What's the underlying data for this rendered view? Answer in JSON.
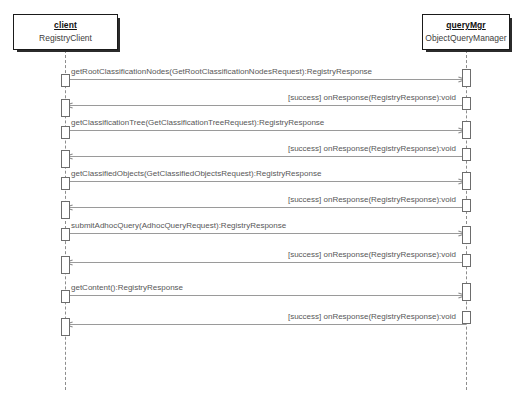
{
  "diagram": {
    "kind": "uml-sequence-diagram",
    "background_color": "#ffffff",
    "line_color": "#9a9a9a",
    "text_color": "#575757"
  },
  "participants": [
    {
      "id": "client",
      "name": "client",
      "class_name": "RegistryClient"
    },
    {
      "id": "queryMgr",
      "name": "queryMgr",
      "class_name": "ObjectQueryManager"
    }
  ],
  "messages": [
    {
      "index": 1,
      "direction": "to-right",
      "from": "client",
      "to": "queryMgr",
      "label": "getRootClassificationNodes(GetRootClassificationNodesRequest):RegistryResponse"
    },
    {
      "index": 2,
      "direction": "to-left",
      "from": "queryMgr",
      "to": "client",
      "label": "[success] onResponse(RegistryResponse):void"
    },
    {
      "index": 3,
      "direction": "to-right",
      "from": "client",
      "to": "queryMgr",
      "label": "getClassificationTree(GetClassificationTreeRequest):RegistryResponse"
    },
    {
      "index": 4,
      "direction": "to-left",
      "from": "queryMgr",
      "to": "client",
      "label": "[success] onResponse(RegistryResponse):void"
    },
    {
      "index": 5,
      "direction": "to-right",
      "from": "client",
      "to": "queryMgr",
      "label": "getClassifiedObjects(GetClassifiedObjectsRequest):RegistryResponse"
    },
    {
      "index": 6,
      "direction": "to-left",
      "from": "queryMgr",
      "to": "client",
      "label": "[success] onResponse(RegistryResponse):void"
    },
    {
      "index": 7,
      "direction": "to-right",
      "from": "client",
      "to": "queryMgr",
      "label": "submitAdhocQuery(AdhocQueryRequest):RegistryResponse"
    },
    {
      "index": 8,
      "direction": "to-left",
      "from": "queryMgr",
      "to": "client",
      "label": "[success] onResponse(RegistryResponse):void"
    },
    {
      "index": 9,
      "direction": "to-right",
      "from": "client",
      "to": "queryMgr",
      "label": "getContent():RegistryResponse"
    },
    {
      "index": 10,
      "direction": "to-left",
      "from": "queryMgr",
      "to": "client",
      "label": "[success] onResponse(RegistryResponse):void"
    }
  ]
}
